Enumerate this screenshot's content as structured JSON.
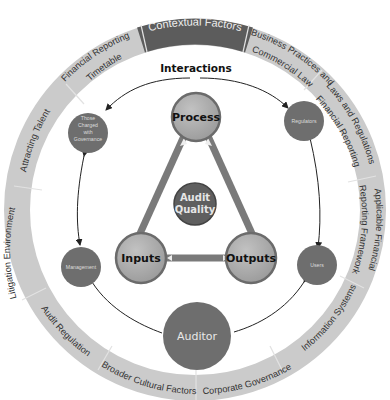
{
  "diagram": {
    "title": "Contextual Factors",
    "interactions_label": "Interactions",
    "ring_segments": [
      {
        "id": "contextual-factors",
        "label": "Contextual Factors",
        "highlight": true
      },
      {
        "id": "business-practices",
        "label_line1": "Business Practices and",
        "label_line2": "Commercial Law"
      },
      {
        "id": "laws-regulations",
        "label_line1": "Laws and Regulations",
        "label_line2": "Financial Reporting"
      },
      {
        "id": "applicable-framework",
        "label_line1": "Applicable Financial",
        "label_line2": "Reporting Framework"
      },
      {
        "id": "information-systems",
        "label": "Information Systems"
      },
      {
        "id": "corporate-governance",
        "label": "Corporate Governance"
      },
      {
        "id": "broader-cultural",
        "label": "Broader Cultural Factors"
      },
      {
        "id": "audit-regulation",
        "label": "Audit Regulation"
      },
      {
        "id": "litigation-environment",
        "label": "Litigation Environment"
      },
      {
        "id": "attracting-talent",
        "label": "Attracting Talent"
      },
      {
        "id": "financial-reporting-timetable",
        "label_line1": "Financial Reporting",
        "label_line2": "Timetable"
      }
    ],
    "core": {
      "process": "Process",
      "inputs": "Inputs",
      "outputs": "Outputs",
      "audit_quality_line1": "Audit",
      "audit_quality_line2": "Quality"
    },
    "stakeholders": {
      "governance_line1": "Those",
      "governance_line2": "Charged",
      "governance_line3": "with",
      "governance_line4": "Governance",
      "regulators": "Regulators",
      "management": "Management",
      "users": "Users",
      "auditor": "Auditor"
    },
    "colors": {
      "ring": "#c9c9c9",
      "ring_highlight": "#5c5c5c",
      "core_fill": "#a9a9a9",
      "core_stroke": "#6b6b6b",
      "stakeholder_fill": "#6e6e6e",
      "audit_quality_fill": "#5f5f5f"
    }
  }
}
